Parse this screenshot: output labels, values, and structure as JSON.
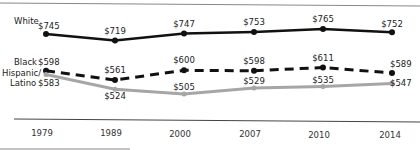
{
  "chart_data": {
    "type": "line",
    "title": "",
    "xlabel": "",
    "ylabel": "",
    "categories": [
      "1979",
      "1989",
      "2000",
      "2007",
      "2010",
      "2014"
    ],
    "series": [
      {
        "name": "White",
        "values": [
          745,
          719,
          747,
          753,
          765,
          752
        ],
        "labels": [
          "$745",
          "$719",
          "$747",
          "$753",
          "$765",
          "$752"
        ],
        "style": "solid",
        "color": "#111111"
      },
      {
        "name": "Black",
        "values": [
          598,
          561,
          600,
          598,
          611,
          589
        ],
        "labels": [
          "$598",
          "$561",
          "$600",
          "$598",
          "$611",
          "$589"
        ],
        "style": "dashed",
        "color": "#111111"
      },
      {
        "name": "Hispanic/ Latino",
        "values": [
          583,
          524,
          505,
          529,
          535,
          547
        ],
        "labels": [
          "$583",
          "$524",
          "$505",
          "$529",
          "$535",
          "$547"
        ],
        "style": "solid",
        "color": "#a6a6a6"
      }
    ],
    "legend_position": "inline-left",
    "grid": false
  },
  "legend": {
    "white": "White",
    "black": "Black",
    "hispanic_line1": "Hispanic/",
    "hispanic_line2": "Latino"
  }
}
